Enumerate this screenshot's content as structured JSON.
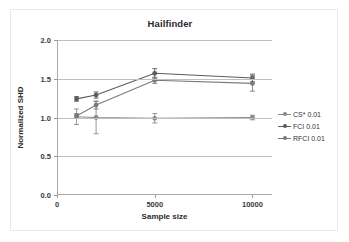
{
  "chart_data": {
    "type": "line",
    "title": "Hailfinder",
    "xlabel": "Sample size",
    "ylabel": "Normalized SHD",
    "xlim": [
      0,
      11000
    ],
    "ylim": [
      0.0,
      2.0
    ],
    "grid": true,
    "legend_position": "right",
    "x": [
      1000,
      2000,
      5000,
      10000
    ],
    "xticks": [
      0,
      5000,
      10000
    ],
    "xtick_labels": [
      "0",
      "5000",
      "10000"
    ],
    "yticks": [
      0.0,
      0.5,
      1.0,
      1.5,
      2.0
    ],
    "ytick_labels": [
      "0.0",
      "0.5",
      "1.0",
      "1.5",
      "2.0"
    ],
    "series": [
      {
        "name": "CS* 0.01",
        "color": "#8a8a8a",
        "values": [
          1.01,
          1.0,
          0.99,
          1.0
        ],
        "yerr": [
          0.1,
          0.21,
          0.06,
          0.03
        ]
      },
      {
        "name": "FCI 0.01",
        "color": "#5b5b5b",
        "values": [
          1.24,
          1.29,
          1.57,
          1.51
        ],
        "yerr": [
          0.03,
          0.04,
          0.06,
          0.05
        ]
      },
      {
        "name": "RFCI 0.01",
        "color": "#7a7a7a",
        "values": [
          1.02,
          1.16,
          1.48,
          1.44
        ],
        "yerr": [
          0.03,
          0.05,
          0.04,
          0.1
        ]
      }
    ]
  },
  "legend": {
    "items": [
      {
        "label": "CS* 0.01"
      },
      {
        "label": "FCI 0.01"
      },
      {
        "label": "RFCI 0.01"
      }
    ]
  }
}
